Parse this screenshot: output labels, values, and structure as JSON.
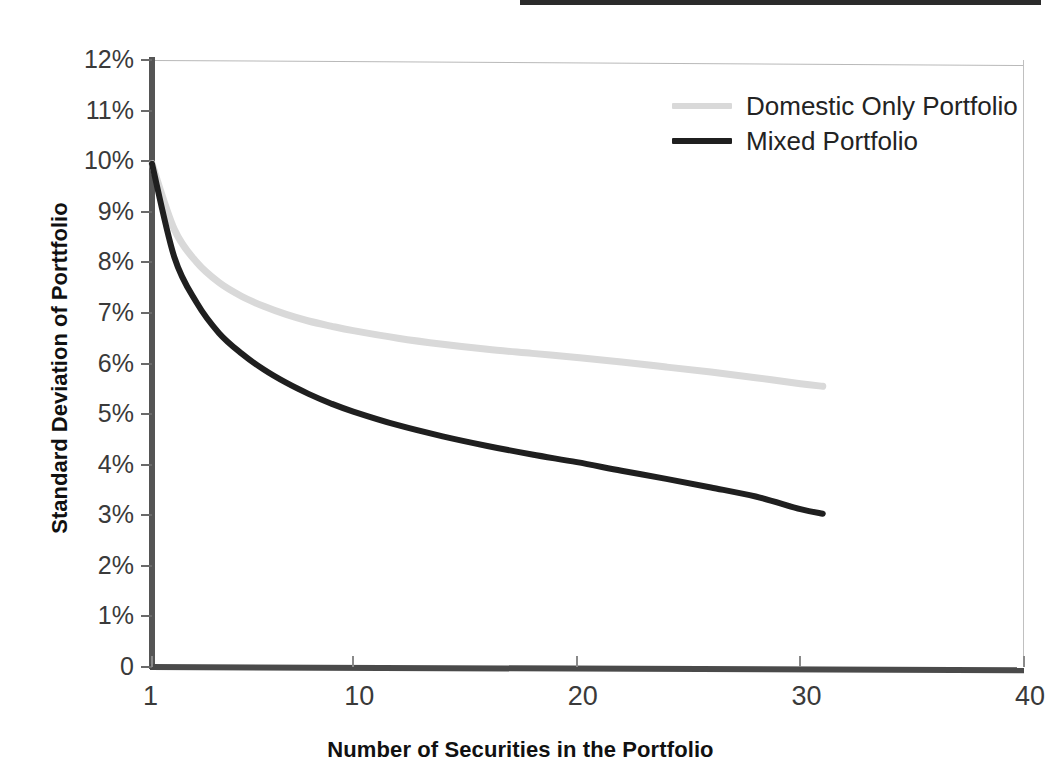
{
  "chart_data": {
    "type": "line",
    "title": "",
    "xlabel": "Number of Securities in the Portfolio",
    "ylabel": "Standard Deviation of Porttfolio",
    "xlim": [
      1,
      40
    ],
    "ylim": [
      0,
      12
    ],
    "grid": false,
    "legend_position": "top-right-inside",
    "xticks": [
      1,
      10,
      20,
      30,
      40
    ],
    "xtick_labels": [
      "1",
      "10",
      "20",
      "30",
      "40"
    ],
    "yticks": [
      0,
      1,
      2,
      3,
      4,
      5,
      6,
      7,
      8,
      9,
      10,
      11,
      12
    ],
    "ytick_labels": [
      "0",
      "1%",
      "2%",
      "3%",
      "4%",
      "5%",
      "6%",
      "7%",
      "8%",
      "9%",
      "10%",
      "11%",
      "12%"
    ],
    "x": [
      1,
      2,
      3,
      4,
      5,
      6,
      7,
      8,
      9,
      10,
      12,
      14,
      16,
      18,
      20,
      22,
      24,
      26,
      28,
      30,
      31
    ],
    "series": [
      {
        "name": "Domestic Only Portfolio",
        "color": "#d9d9d9",
        "values": [
          9.95,
          8.65,
          8.0,
          7.6,
          7.33,
          7.13,
          6.97,
          6.84,
          6.74,
          6.65,
          6.5,
          6.38,
          6.28,
          6.2,
          6.12,
          6.03,
          5.93,
          5.83,
          5.72,
          5.6,
          5.55
        ]
      },
      {
        "name": "Mixed Portfolio",
        "color": "#1f1f1f",
        "values": [
          9.95,
          8.1,
          7.2,
          6.6,
          6.2,
          5.88,
          5.62,
          5.4,
          5.21,
          5.05,
          4.78,
          4.56,
          4.37,
          4.2,
          4.05,
          3.88,
          3.72,
          3.55,
          3.37,
          3.12,
          3.03
        ]
      }
    ]
  },
  "axes": {
    "y_title": "Standard Deviation of Porttfolio",
    "x_title": "Number of Securities in the Portfolio"
  },
  "legend": {
    "entries": [
      {
        "label": "Domestic Only Portfolio",
        "color": "#d9d9d9"
      },
      {
        "label": "Mixed Portfolio",
        "color": "#1f1f1f"
      }
    ]
  },
  "colors": {
    "domestic": "#d9d9d9",
    "mixed": "#1f1f1f",
    "axis": "#4a4a4a",
    "tick_text": "#3a3a3a",
    "title_text": "#111111",
    "background": "#ffffff"
  }
}
